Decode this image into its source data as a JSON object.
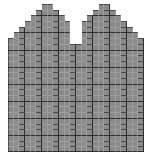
{
  "figure": {
    "title": "",
    "background_color": "#ffffff",
    "fill_color": "#8b8b8b",
    "minor_grid_color": "#9e9e9e",
    "cell_border_color": "#4a4a4a",
    "major_grid_color": "#2e2e2e"
  },
  "chart_data": {
    "type": "bar",
    "title": "",
    "subtitle": "",
    "xlabel": "",
    "ylabel": "",
    "grid": true,
    "legend_position": "none",
    "note": "Pixelated bimodal staircase histogram; each bar is drawn as a stack of unit grid cells.",
    "cell_width_px": 5.67,
    "cell_height_px": 5.69,
    "columns": 24,
    "rows": 26,
    "xlim": [
      0,
      24
    ],
    "ylim": [
      0,
      26
    ],
    "categories": [
      "1",
      "2",
      "3",
      "4",
      "5",
      "6",
      "7",
      "8",
      "9",
      "10",
      "11",
      "12",
      "13",
      "14",
      "15",
      "16",
      "17",
      "18",
      "19",
      "20",
      "21",
      "22",
      "23",
      "24"
    ],
    "values": [
      20,
      21,
      22,
      23,
      24,
      25,
      26,
      26,
      25,
      24,
      23,
      19,
      19,
      23,
      24,
      25,
      26,
      26,
      25,
      24,
      23,
      22,
      21,
      20
    ],
    "tick_labels_x": [],
    "tick_labels_y": [],
    "annotations": []
  }
}
